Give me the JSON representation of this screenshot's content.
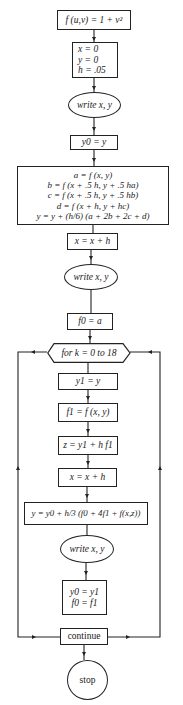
{
  "flowchart": {
    "title": "Runge-Kutta start with Simpson predictor-corrector flowchart",
    "nodes": {
      "define_f": "f (u,v) = 1 + v²",
      "init": [
        "x = 0",
        "y = 0",
        "h = .05"
      ],
      "write1": "write x, y",
      "save_y0": "y0 = y",
      "rk_step": [
        "a = f (x, y)",
        "b = f (x + .5 h, y + .5 ha)",
        "c = f (x + .5 h, y + .5 hb)",
        "d = f (x + h, y + hc)",
        "y = y + (h/6) (a + 2b + 2c + d)"
      ],
      "advance_x1": "x = x + h",
      "write2": "write x, y",
      "set_f0": "f0 = a",
      "loop": "for k = 0 to 18",
      "save_y1": "y1 = y",
      "eval_f1": "f1 = f (x, y)",
      "predict_z": "z = y1 + h f1",
      "advance_x2": "x = x + h",
      "correct_y": "y = y0 + h/3 (f0 + 4f1 + f(x,z))",
      "write3": "write x, y",
      "shift": [
        "y0 = y1",
        "f0 = f1"
      ],
      "continue": "continue",
      "stop": "stop"
    },
    "colors": {
      "line": "#222222",
      "background": "#ffffff"
    }
  }
}
